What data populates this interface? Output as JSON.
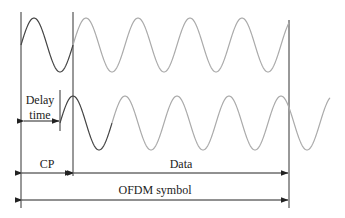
{
  "labels": {
    "delay_line1": "Delay",
    "delay_line2": "time",
    "cp": "CP",
    "data": "Data",
    "ofdm_symbol": "OFDM symbol"
  },
  "colors": {
    "cp_wave": "#444444",
    "data_wave": "#aaaaaa",
    "lines": "#333333",
    "text": "#222222"
  }
}
